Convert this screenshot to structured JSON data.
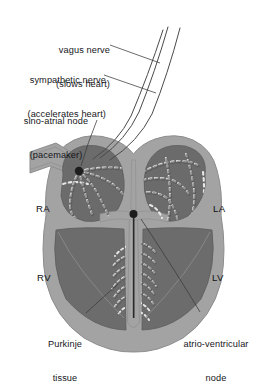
{
  "figure": {
    "background_color": "#ffffff",
    "ink_color": "#16161a"
  },
  "colors": {
    "myocardium_fill": "#6e6e6e",
    "wall_fill": "#a3a3a3",
    "cavity_fill": "#6a6a6a",
    "node_dot": "#1d1d1d",
    "fiber_outline": "#efefef",
    "leader_line": "#3a3a3a",
    "nerve_line": "#4a4a4a"
  },
  "callouts": [
    {
      "id": "vagus-nerve",
      "line1": "vagus nerve",
      "line2": "(slows heart)",
      "align": "right",
      "x": 30,
      "y": 24
    },
    {
      "id": "sympathetic-nerve",
      "line1": "sympathetic nerve",
      "line2": "(accelerates heart)",
      "align": "right",
      "x": 6,
      "y": 54
    },
    {
      "id": "sino-atrial-node",
      "line1": "sino-atrial node",
      "line2": "(pacemaker)",
      "align": "right",
      "x": 14,
      "y": 95
    },
    {
      "id": "purkinje-tissue",
      "line1": "Purkinje",
      "line2": "tissue",
      "align": "center",
      "x": 44,
      "y": 318
    },
    {
      "id": "atrio-ventricular-node",
      "line1": "atrio-ventricular",
      "line2": "node",
      "align": "center",
      "x": 180,
      "y": 318
    }
  ],
  "chamber_labels": [
    {
      "id": "right-atrium",
      "text": "RA",
      "x": 36,
      "y": 203
    },
    {
      "id": "left-atrium",
      "text": "LA",
      "x": 213,
      "y": 203
    },
    {
      "id": "right-ventricle",
      "text": "RV",
      "x": 37,
      "y": 272
    },
    {
      "id": "left-ventricle",
      "text": "LV",
      "x": 212,
      "y": 272
    }
  ],
  "anatomy": {
    "structures": [
      "superior vena cava stub",
      "right atrium",
      "left atrium",
      "right ventricle",
      "left ventricle",
      "interventricular septum",
      "sino-atrial node",
      "atrio-ventricular node",
      "bundle of His",
      "bundle branches",
      "Purkinje fibres",
      "internodal conduction pathways"
    ],
    "node_markers": [
      {
        "id": "sa-node-marker",
        "x": 79,
        "y": 171,
        "r": 4.2
      },
      {
        "id": "av-node-marker",
        "x": 133,
        "y": 214,
        "r": 4.0
      }
    ]
  }
}
